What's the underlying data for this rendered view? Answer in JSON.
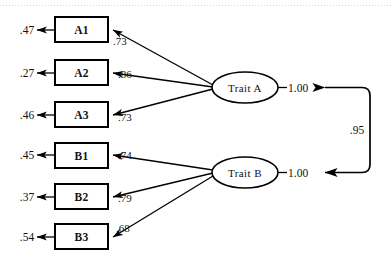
{
  "diagram": {
    "type": "path-diagram",
    "title": "",
    "indicators": [
      {
        "name": "A1",
        "residual": ".47",
        "loading": ".73",
        "factor": "Trait A"
      },
      {
        "name": "A2",
        "residual": ".27",
        "loading": ".86",
        "factor": "Trait A"
      },
      {
        "name": "A3",
        "residual": ".46",
        "loading": ".73",
        "factor": "Trait A"
      },
      {
        "name": "B1",
        "residual": ".45",
        "loading": ".74",
        "factor": "Trait B"
      },
      {
        "name": "B2",
        "residual": ".37",
        "loading": ".79",
        "factor": "Trait B"
      },
      {
        "name": "B3",
        "residual": ".54",
        "loading": ".68",
        "factor": "Trait B"
      }
    ],
    "factors": [
      {
        "name": "Trait A",
        "variance": "1.00"
      },
      {
        "name": "Trait B",
        "variance": "1.00"
      }
    ],
    "correlation": {
      "label": ".95",
      "between": [
        "Trait A",
        "Trait B"
      ]
    }
  }
}
